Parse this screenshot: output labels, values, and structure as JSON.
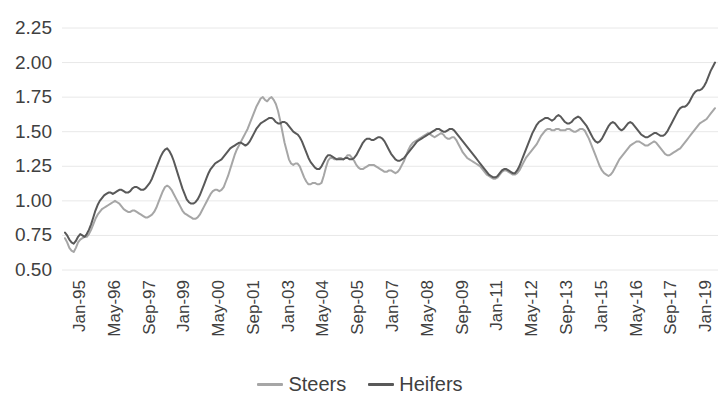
{
  "chart_data": {
    "type": "line",
    "title": "",
    "subtitle": "",
    "xlabel": "",
    "ylabel": "",
    "ylim": [
      0.5,
      2.25
    ],
    "ytick_values": [
      0.5,
      0.75,
      1.0,
      1.25,
      1.5,
      1.75,
      2.0,
      2.25
    ],
    "ytick_labels": [
      "0.50",
      "0.75",
      "1.00",
      "1.25",
      "1.50",
      "1.75",
      "2.00",
      "2.25"
    ],
    "grid": true,
    "grid_axis": "y",
    "grid_color": "#E8E8E8",
    "legend_position": "bottom",
    "x_tick_labels": [
      "Jan-95",
      "May-96",
      "Sep-97",
      "Jan-99",
      "May-00",
      "Sep-01",
      "Jan-03",
      "May-04",
      "Sep-05",
      "Jan-07",
      "May-08",
      "Sep-09",
      "Jan-11",
      "May-12",
      "Sep-13",
      "Jan-15",
      "May-16",
      "Sep-17",
      "Jan-19"
    ],
    "x_tick_interval_months": 16,
    "x_start": "Jan-95",
    "x_end": "Dec-19",
    "n_points": 300,
    "series": [
      {
        "name": "Steers",
        "color": "#A6A6A6",
        "values": [
          0.73,
          0.7,
          0.66,
          0.64,
          0.63,
          0.66,
          0.7,
          0.72,
          0.73,
          0.74,
          0.74,
          0.76,
          0.79,
          0.83,
          0.87,
          0.9,
          0.92,
          0.94,
          0.95,
          0.96,
          0.97,
          0.98,
          0.99,
          1.0,
          0.99,
          0.98,
          0.96,
          0.94,
          0.93,
          0.92,
          0.92,
          0.93,
          0.93,
          0.92,
          0.91,
          0.9,
          0.89,
          0.88,
          0.88,
          0.89,
          0.9,
          0.92,
          0.95,
          0.99,
          1.03,
          1.07,
          1.1,
          1.11,
          1.1,
          1.08,
          1.05,
          1.02,
          0.99,
          0.96,
          0.93,
          0.91,
          0.9,
          0.89,
          0.88,
          0.87,
          0.87,
          0.88,
          0.9,
          0.93,
          0.96,
          0.99,
          1.02,
          1.05,
          1.07,
          1.08,
          1.08,
          1.07,
          1.08,
          1.1,
          1.14,
          1.18,
          1.23,
          1.28,
          1.33,
          1.37,
          1.4,
          1.43,
          1.46,
          1.49,
          1.52,
          1.56,
          1.6,
          1.64,
          1.68,
          1.71,
          1.74,
          1.75,
          1.73,
          1.72,
          1.74,
          1.75,
          1.73,
          1.7,
          1.65,
          1.58,
          1.5,
          1.42,
          1.36,
          1.3,
          1.27,
          1.26,
          1.27,
          1.27,
          1.25,
          1.21,
          1.17,
          1.14,
          1.12,
          1.12,
          1.13,
          1.13,
          1.12,
          1.12,
          1.13,
          1.18,
          1.24,
          1.29,
          1.31,
          1.31,
          1.3,
          1.3,
          1.31,
          1.31,
          1.3,
          1.31,
          1.33,
          1.33,
          1.31,
          1.29,
          1.26,
          1.24,
          1.23,
          1.23,
          1.24,
          1.25,
          1.26,
          1.26,
          1.26,
          1.25,
          1.24,
          1.23,
          1.22,
          1.21,
          1.21,
          1.22,
          1.22,
          1.21,
          1.2,
          1.21,
          1.23,
          1.26,
          1.29,
          1.33,
          1.37,
          1.4,
          1.42,
          1.43,
          1.44,
          1.45,
          1.46,
          1.47,
          1.48,
          1.49,
          1.48,
          1.47,
          1.46,
          1.47,
          1.48,
          1.49,
          1.48,
          1.46,
          1.45,
          1.45,
          1.46,
          1.46,
          1.44,
          1.41,
          1.38,
          1.35,
          1.33,
          1.31,
          1.3,
          1.29,
          1.28,
          1.27,
          1.26,
          1.25,
          1.23,
          1.21,
          1.19,
          1.18,
          1.17,
          1.16,
          1.16,
          1.17,
          1.19,
          1.21,
          1.22,
          1.22,
          1.21,
          1.2,
          1.19,
          1.19,
          1.2,
          1.22,
          1.25,
          1.28,
          1.31,
          1.33,
          1.35,
          1.37,
          1.39,
          1.41,
          1.44,
          1.47,
          1.49,
          1.51,
          1.52,
          1.52,
          1.51,
          1.51,
          1.52,
          1.52,
          1.51,
          1.51,
          1.51,
          1.52,
          1.52,
          1.51,
          1.5,
          1.5,
          1.51,
          1.52,
          1.52,
          1.51,
          1.48,
          1.45,
          1.41,
          1.37,
          1.33,
          1.29,
          1.25,
          1.22,
          1.2,
          1.19,
          1.18,
          1.19,
          1.21,
          1.24,
          1.27,
          1.3,
          1.32,
          1.34,
          1.36,
          1.38,
          1.4,
          1.41,
          1.42,
          1.43,
          1.43,
          1.42,
          1.41,
          1.4,
          1.4,
          1.41,
          1.42,
          1.43,
          1.42,
          1.4,
          1.38,
          1.36,
          1.34,
          1.33,
          1.33,
          1.34,
          1.35,
          1.36,
          1.37,
          1.38,
          1.4,
          1.42,
          1.44,
          1.46,
          1.48,
          1.5,
          1.52,
          1.54,
          1.56,
          1.57,
          1.58,
          1.59,
          1.61,
          1.63,
          1.65,
          1.67
        ]
      },
      {
        "name": "Heifers",
        "color": "#595959",
        "values": [
          0.77,
          0.75,
          0.72,
          0.7,
          0.69,
          0.71,
          0.74,
          0.76,
          0.75,
          0.74,
          0.76,
          0.79,
          0.83,
          0.88,
          0.93,
          0.97,
          1.0,
          1.02,
          1.04,
          1.05,
          1.06,
          1.06,
          1.05,
          1.06,
          1.07,
          1.08,
          1.08,
          1.07,
          1.06,
          1.06,
          1.07,
          1.09,
          1.1,
          1.1,
          1.09,
          1.08,
          1.08,
          1.09,
          1.11,
          1.13,
          1.16,
          1.2,
          1.24,
          1.28,
          1.32,
          1.35,
          1.37,
          1.38,
          1.36,
          1.33,
          1.29,
          1.24,
          1.19,
          1.14,
          1.09,
          1.05,
          1.01,
          0.99,
          0.98,
          0.98,
          0.99,
          1.01,
          1.04,
          1.08,
          1.12,
          1.16,
          1.2,
          1.23,
          1.25,
          1.27,
          1.28,
          1.29,
          1.3,
          1.32,
          1.34,
          1.36,
          1.38,
          1.39,
          1.4,
          1.41,
          1.42,
          1.42,
          1.41,
          1.4,
          1.41,
          1.43,
          1.46,
          1.49,
          1.52,
          1.54,
          1.56,
          1.57,
          1.58,
          1.59,
          1.6,
          1.6,
          1.59,
          1.57,
          1.56,
          1.56,
          1.57,
          1.57,
          1.56,
          1.54,
          1.52,
          1.5,
          1.49,
          1.48,
          1.46,
          1.43,
          1.39,
          1.35,
          1.31,
          1.28,
          1.26,
          1.24,
          1.23,
          1.23,
          1.25,
          1.28,
          1.31,
          1.33,
          1.33,
          1.32,
          1.31,
          1.3,
          1.3,
          1.3,
          1.3,
          1.31,
          1.31,
          1.3,
          1.3,
          1.31,
          1.33,
          1.36,
          1.39,
          1.42,
          1.44,
          1.45,
          1.45,
          1.44,
          1.44,
          1.45,
          1.46,
          1.46,
          1.45,
          1.43,
          1.4,
          1.37,
          1.34,
          1.32,
          1.3,
          1.29,
          1.29,
          1.3,
          1.31,
          1.33,
          1.35,
          1.37,
          1.39,
          1.41,
          1.43,
          1.44,
          1.45,
          1.46,
          1.47,
          1.48,
          1.49,
          1.5,
          1.51,
          1.52,
          1.52,
          1.51,
          1.5,
          1.5,
          1.51,
          1.52,
          1.52,
          1.51,
          1.49,
          1.47,
          1.45,
          1.43,
          1.41,
          1.39,
          1.37,
          1.35,
          1.33,
          1.31,
          1.29,
          1.27,
          1.25,
          1.23,
          1.21,
          1.19,
          1.18,
          1.17,
          1.17,
          1.18,
          1.2,
          1.22,
          1.23,
          1.23,
          1.22,
          1.21,
          1.2,
          1.2,
          1.22,
          1.25,
          1.29,
          1.33,
          1.37,
          1.41,
          1.45,
          1.49,
          1.52,
          1.55,
          1.57,
          1.58,
          1.59,
          1.6,
          1.6,
          1.59,
          1.58,
          1.59,
          1.61,
          1.62,
          1.61,
          1.59,
          1.57,
          1.56,
          1.56,
          1.57,
          1.59,
          1.6,
          1.61,
          1.6,
          1.58,
          1.56,
          1.54,
          1.51,
          1.48,
          1.45,
          1.43,
          1.42,
          1.43,
          1.45,
          1.48,
          1.51,
          1.54,
          1.56,
          1.57,
          1.56,
          1.54,
          1.52,
          1.51,
          1.52,
          1.54,
          1.56,
          1.57,
          1.56,
          1.54,
          1.52,
          1.5,
          1.48,
          1.47,
          1.46,
          1.46,
          1.47,
          1.48,
          1.49,
          1.49,
          1.48,
          1.47,
          1.47,
          1.48,
          1.5,
          1.53,
          1.56,
          1.59,
          1.62,
          1.65,
          1.67,
          1.68,
          1.68,
          1.69,
          1.71,
          1.74,
          1.77,
          1.79,
          1.8,
          1.8,
          1.81,
          1.83,
          1.86,
          1.9,
          1.94,
          1.97,
          2.0
        ]
      }
    ]
  },
  "legend": {
    "items": [
      {
        "label": "Steers",
        "color": "#A6A6A6"
      },
      {
        "label": "Heifers",
        "color": "#595959"
      }
    ]
  }
}
